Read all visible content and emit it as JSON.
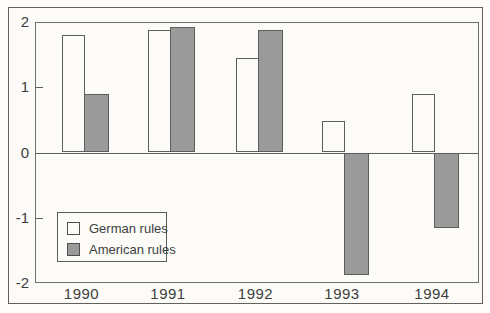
{
  "figure": {
    "background_color": "#fcfbf8",
    "border_color": "#62615e",
    "text_color": "#3e3e3e",
    "axis_color": "#707070",
    "bar_border_color": "#5d5d5d"
  },
  "chart_data": {
    "type": "bar",
    "title": "",
    "xlabel": "",
    "ylabel": "",
    "categories": [
      "1990",
      "1991",
      "1992",
      "1993",
      "1994"
    ],
    "series": [
      {
        "name": "German rules",
        "color": "#fcfbf8",
        "values": [
          1.8,
          1.87,
          1.45,
          0.48,
          0.9
        ]
      },
      {
        "name": "American rules",
        "color": "#9a9a9a",
        "values": [
          0.9,
          1.92,
          1.87,
          -1.88,
          -1.15
        ]
      }
    ],
    "ylim": [
      -2,
      2
    ],
    "yticks": [
      2,
      1,
      0,
      -1,
      -2
    ],
    "inner_tick_values": [
      1,
      -1
    ],
    "grid": false,
    "legend_position": "lower-left",
    "legend_entries": [
      "German rules",
      "American rules"
    ]
  }
}
